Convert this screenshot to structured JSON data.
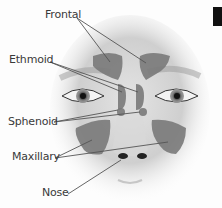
{
  "diagram": {
    "labels": [
      {
        "id": "frontal",
        "text": "Frontal"
      },
      {
        "id": "ethmoid",
        "text": "Ethmoid"
      },
      {
        "id": "sphenoid",
        "text": "Sphenoid"
      },
      {
        "id": "maxillary",
        "text": "Maxillary"
      },
      {
        "id": "nose",
        "text": "Nose"
      }
    ],
    "colors": {
      "sinus_fill": "#7a7a7a",
      "leader_line": "#555555",
      "label_text": "#3a3a3a",
      "skin": "#e6e6e6"
    }
  }
}
